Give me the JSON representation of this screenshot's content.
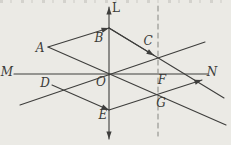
{
  "figure": {
    "width": 231,
    "height": 145,
    "background_color": "#ebeae5",
    "stroke_color": "#3e3e3c",
    "dashed_color": "#8f8f8b",
    "label_font_size": 12,
    "lines": [
      {
        "name": "axis-L-upper",
        "x1": 109,
        "y1": 75,
        "x2": 109,
        "y2": 7,
        "arrow_end": true
      },
      {
        "name": "axis-L-lower",
        "x1": 109,
        "y1": 75,
        "x2": 109,
        "y2": 139,
        "arrow_end": true
      },
      {
        "name": "axis-MN",
        "x1": 14,
        "y1": 74,
        "x2": 208,
        "y2": 74
      },
      {
        "name": "dashed-vertical-line",
        "x1": 158,
        "y1": 6,
        "x2": 158,
        "y2": 136,
        "dashed": true
      },
      {
        "name": "line-through-O",
        "x1": 20,
        "y1": 105,
        "x2": 205,
        "y2": 42
      },
      {
        "name": "line-A-O-G",
        "x1": 48,
        "y1": 47,
        "x2": 226,
        "y2": 125
      },
      {
        "name": "line-B-C-extended",
        "x1": 109,
        "y1": 28,
        "x2": 224,
        "y2": 98
      },
      {
        "name": "vector-A-B",
        "x1": 48,
        "y1": 47,
        "x2": 109,
        "y2": 28,
        "arrow_end": true
      },
      {
        "name": "vector-B-C",
        "x1": 109,
        "y1": 28,
        "x2": 154,
        "y2": 55.4,
        "arrow_end": true
      },
      {
        "name": "vector-D-E",
        "x1": 52,
        "y1": 85,
        "x2": 109,
        "y2": 110,
        "arrow_end": true
      },
      {
        "name": "ray-E-G-N",
        "x1": 109,
        "y1": 110,
        "x2": 202,
        "y2": 80,
        "arrow_end": true
      }
    ],
    "labels": [
      {
        "name": "label-L",
        "text": "L",
        "x": 116,
        "y": 8,
        "upright": true
      },
      {
        "name": "label-M",
        "text": "M",
        "x": 7,
        "y": 72
      },
      {
        "name": "label-N",
        "text": "N",
        "x": 212,
        "y": 72
      },
      {
        "name": "label-A",
        "text": "A",
        "x": 40,
        "y": 48
      },
      {
        "name": "label-B",
        "text": "B",
        "x": 99,
        "y": 38
      },
      {
        "name": "label-C",
        "text": "C",
        "x": 148,
        "y": 41
      },
      {
        "name": "label-O",
        "text": "O",
        "x": 101,
        "y": 82
      },
      {
        "name": "label-D",
        "text": "D",
        "x": 45,
        "y": 83
      },
      {
        "name": "label-E",
        "text": "E",
        "x": 103,
        "y": 115
      },
      {
        "name": "label-F",
        "text": "F",
        "x": 162,
        "y": 80
      },
      {
        "name": "label-G",
        "text": "G",
        "x": 161,
        "y": 103
      }
    ]
  }
}
